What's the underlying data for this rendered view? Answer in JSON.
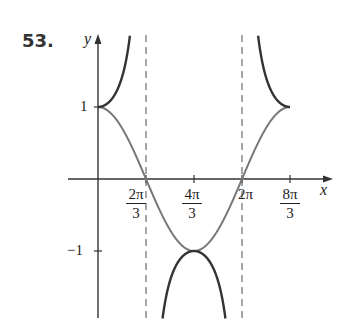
{
  "problem_number": "53.",
  "chart_data": {
    "type": "line",
    "title": "",
    "xlabel": "x",
    "ylabel": "y",
    "xlim": [
      -1.2,
      3.4
    ],
    "ylim": [
      -1.9,
      2.0
    ],
    "grid": false,
    "x_tick_labels": [
      "2π/3",
      "4π/3",
      "2π",
      "8π/3"
    ],
    "x_ticks": [
      2.0944,
      4.1888,
      6.2832,
      8.3776
    ],
    "y_tick_labels": [
      "1",
      "-1"
    ],
    "y_ticks": [
      1,
      -1
    ],
    "asymptotes": [
      {
        "x_label": "2π/3",
        "x": 2.0944
      },
      {
        "x_label": "2π",
        "x": 6.2832
      }
    ],
    "series": [
      {
        "name": "y = sec(3x/4)",
        "style": "solid dark",
        "color": "#333333",
        "key_points": [
          {
            "x": 0,
            "y": 1
          },
          {
            "x": 4.1888,
            "y": -1
          },
          {
            "x": 8.3776,
            "y": 1
          }
        ]
      },
      {
        "name": "y = cos(3x/4)",
        "style": "solid gray",
        "color": "#777777",
        "key_points": [
          {
            "x": 0,
            "y": 1
          },
          {
            "x": 2.0944,
            "y": 0
          },
          {
            "x": 4.1888,
            "y": -1
          },
          {
            "x": 6.2832,
            "y": 0
          },
          {
            "x": 8.3776,
            "y": 1
          }
        ]
      }
    ],
    "legend": null
  },
  "labels": {
    "x_axis": "x",
    "y_axis": "y",
    "y_pos": "1",
    "y_neg": "−1",
    "t1_num": "2π",
    "t1_den": "3",
    "t2_num": "4π",
    "t2_den": "3",
    "t3": "2π",
    "t4_num": "8π",
    "t4_den": "3"
  },
  "colors": {
    "axis": "#333333",
    "sec": "#333333",
    "cos": "#777777",
    "asymptote": "#777777"
  }
}
